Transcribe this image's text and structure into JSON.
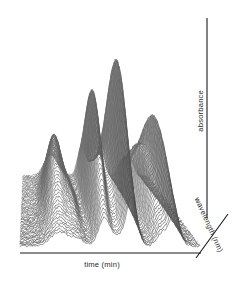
{
  "figure": {
    "background_color": "#ffffff",
    "mesh_color": "#555555",
    "axis_color": "#1a1a1a",
    "label_color": "#2b2b2b"
  },
  "axes": {
    "x": {
      "label": "time (min)",
      "name": "time-axis"
    },
    "y": {
      "label": "wavelength (nm)",
      "name": "wavelength-axis"
    },
    "z": {
      "label": "absorbance",
      "name": "absorbance-axis"
    }
  },
  "chart_data": {
    "type": "line",
    "title": "",
    "subtitle": "",
    "xlabel": "time (min)",
    "ylabel": "absorbance",
    "zlabel": "wavelength (nm)",
    "projection": "3d-mesh-surface",
    "grid": false,
    "legend": "none",
    "xlim": [
      0,
      100
    ],
    "ylim": [
      0,
      100
    ],
    "zlim": [
      0,
      100
    ],
    "surface_style": "horizontal-wire-mesh",
    "baseline_noise": true,
    "categories": [
      "peak 1",
      "peak 2",
      "peak 3",
      "peak 4",
      "peak 5",
      "peak 6",
      "peak 7"
    ],
    "series": [
      {
        "name": "absorbance surface",
        "peaks": [
          {
            "label": "peak 1",
            "time": 22,
            "height": 46,
            "width": 5.0,
            "shade": "mid"
          },
          {
            "label": "peak 2",
            "time": 32,
            "height": 12,
            "width": 3.5,
            "shade": "light"
          },
          {
            "label": "peak 3",
            "time": 47,
            "height": 78,
            "width": 3.2,
            "shade": "dark"
          },
          {
            "label": "peak 4",
            "time": 55,
            "height": 26,
            "width": 2.6,
            "shade": "mid"
          },
          {
            "label": "peak 5",
            "time": 62,
            "height": 100,
            "width": 3.0,
            "shade": "dark"
          },
          {
            "label": "peak 6",
            "time": 79,
            "height": 38,
            "width": 3.0,
            "shade": "dark"
          },
          {
            "label": "peak 7",
            "time": 86,
            "height": 62,
            "width": 2.8,
            "shade": "mid"
          }
        ],
        "values": [
          46,
          12,
          78,
          26,
          100,
          38,
          62
        ]
      }
    ],
    "x": [
      22,
      32,
      47,
      55,
      62,
      79,
      86
    ],
    "values": [
      46,
      12,
      78,
      26,
      100,
      38,
      62
    ]
  }
}
